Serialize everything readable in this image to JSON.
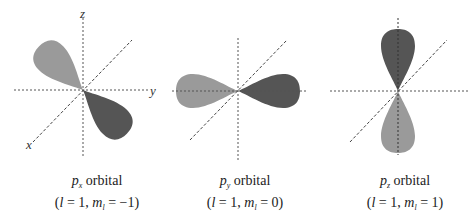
{
  "colors": {
    "dark_lobe": "#555555",
    "light_lobe": "#9a9a9a",
    "axis": "#555555"
  },
  "axis_labels": {
    "x": "x",
    "y": "y",
    "z": "z"
  },
  "orbitals": [
    {
      "symbol": "p",
      "subscript": "x",
      "word": "orbital",
      "l_label": "l",
      "l_value": "1",
      "m_label": "m",
      "m_sub": "l",
      "m_value": "−1"
    },
    {
      "symbol": "p",
      "subscript": "y",
      "word": "orbital",
      "l_label": "l",
      "l_value": "1",
      "m_label": "m",
      "m_sub": "l",
      "m_value": "0"
    },
    {
      "symbol": "p",
      "subscript": "z",
      "word": "orbital",
      "l_label": "l",
      "l_value": "1",
      "m_label": "m",
      "m_sub": "l",
      "m_value": "1"
    }
  ]
}
